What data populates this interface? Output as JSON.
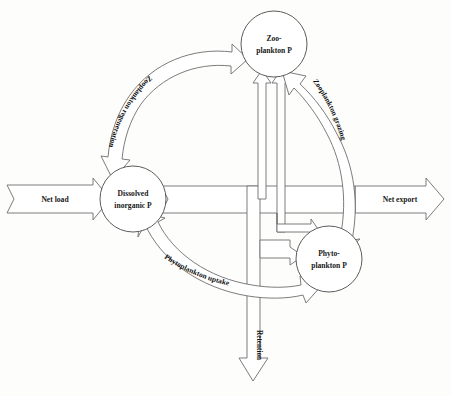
{
  "diagram": {
    "background_color": "#fdfdfc",
    "line_color": "#6d6d6d",
    "text_color": "#181818",
    "nodes": [
      {
        "id": "zooplankton",
        "line1": "Zoo-",
        "line2": "plankton P",
        "cx": 274,
        "cy": 44,
        "r": 33
      },
      {
        "id": "dissolved",
        "line1": "Dissolved",
        "line2": "inorganic P",
        "cx": 133,
        "cy": 199,
        "r": 33
      },
      {
        "id": "phytoplankton",
        "line1": "Phyto-",
        "line2": "plankton P",
        "cx": 329,
        "cy": 259,
        "r": 33
      }
    ],
    "io_flows": [
      {
        "id": "net-load",
        "label": "Net load",
        "x": 55,
        "y": 200
      },
      {
        "id": "net-export",
        "label": "Net export",
        "x": 400,
        "y": 200
      },
      {
        "id": "retention",
        "label": "Retention",
        "x": 253,
        "y": 345
      }
    ],
    "process_flows": [
      {
        "id": "zooplankton-regeneration",
        "label": "Zooplankton regeneration"
      },
      {
        "id": "zooplankton-grazing",
        "label": "Zooplankton grazing"
      },
      {
        "id": "phytoplankton-uptake",
        "label": "Phytoplankton uptake"
      }
    ]
  }
}
